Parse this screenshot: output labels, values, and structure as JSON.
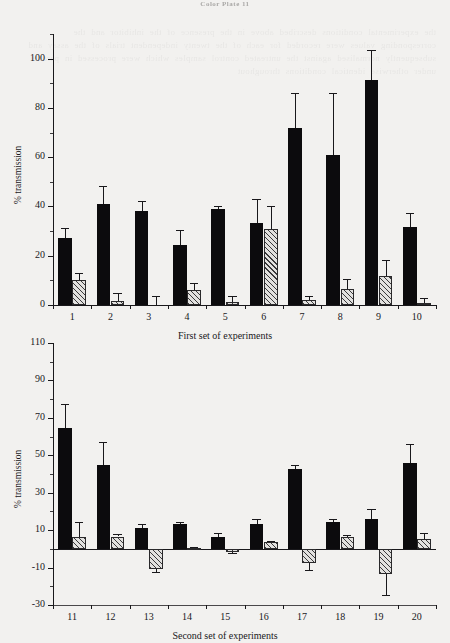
{
  "page": {
    "header_text": "Color Plate 11",
    "bleed_text": "the experimental conditions described above in the presence of the inhibitor and the corresponding values were recorded for each of the twenty independent trials of the assay and subsequently normalised against the untreated control samples which were processed in parallel under otherwise identical conditions throughout"
  },
  "chart_data": [
    {
      "id": "first-set",
      "type": "bar",
      "title": "",
      "xlabel": "First set of experiments",
      "ylabel": "% transmission",
      "ylim": [
        0,
        110
      ],
      "yticks": [
        0,
        20,
        40,
        60,
        80,
        100
      ],
      "ytick_minor_step": 10,
      "grid": false,
      "legend": "none",
      "categories": [
        "1",
        "2",
        "3",
        "4",
        "5",
        "6",
        "7",
        "8",
        "9",
        "10"
      ],
      "series": [
        {
          "name": "solid",
          "fill": "solid-black",
          "values": [
            27.3,
            41.0,
            38.2,
            24.4,
            38.8,
            33.4,
            71.9,
            60.8,
            91.2,
            31.8
          ],
          "errors": [
            4.0,
            7.5,
            4.2,
            6.2,
            1.5,
            9.8,
            14.0,
            25.2,
            12.5,
            5.5
          ]
        },
        {
          "name": "hatched",
          "fill": "diagonal-hatch",
          "values": [
            10.1,
            1.8,
            0.0,
            6.2,
            1.3,
            30.9,
            2.2,
            6.5,
            11.7,
            1.0
          ],
          "errors": [
            3.0,
            3.2,
            3.8,
            2.6,
            2.3,
            9.3,
            1.4,
            4.1,
            6.4,
            2.0
          ]
        }
      ]
    },
    {
      "id": "second-set",
      "type": "bar",
      "title": "",
      "xlabel": "Second set of experiments",
      "ylabel": "% transmission",
      "ylim": [
        -30,
        110
      ],
      "yticks": [
        -30,
        -10,
        10,
        30,
        50,
        70,
        90,
        110
      ],
      "ytick_minor_step": 10,
      "grid": false,
      "legend": "none",
      "categories": [
        "11",
        "12",
        "13",
        "14",
        "15",
        "16",
        "17",
        "18",
        "19",
        "20"
      ],
      "series": [
        {
          "name": "solid",
          "fill": "solid-black",
          "values": [
            64.5,
            44.8,
            11.2,
            13.2,
            6.3,
            13.4,
            42.6,
            14.2,
            16.0,
            46.0
          ],
          "errors": [
            13.0,
            12.5,
            2.0,
            1.3,
            2.2,
            2.8,
            2.0,
            1.6,
            5.3,
            10.0
          ]
        },
        {
          "name": "hatched",
          "fill": "diagonal-hatch",
          "values": [
            6.2,
            6.6,
            -10.7,
            0.4,
            -1.7,
            3.4,
            -7.3,
            6.4,
            -13.5,
            5.2
          ],
          "errors": [
            8.0,
            1.2,
            1.8,
            0.6,
            0.5,
            0.8,
            4.0,
            1.0,
            11.0,
            3.5
          ]
        }
      ]
    }
  ]
}
